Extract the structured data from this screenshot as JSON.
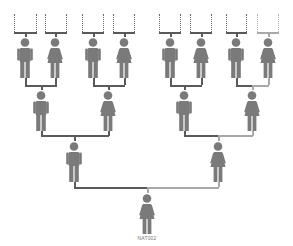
{
  "diagram": {
    "type": "pedigree-chart",
    "figure_color": "#7a7a7a",
    "line_color": "#5a5a5a",
    "light_line_color": "#a8a8a8",
    "root_label": "NAT002"
  },
  "generations": [
    {
      "level": 1,
      "people": [
        {
          "sex": "female",
          "label": "NAT002"
        }
      ]
    },
    {
      "level": 2,
      "people": [
        {
          "sex": "male"
        },
        {
          "sex": "female"
        }
      ]
    },
    {
      "level": 3,
      "people": [
        {
          "sex": "male"
        },
        {
          "sex": "female"
        },
        {
          "sex": "male"
        },
        {
          "sex": "female"
        }
      ]
    },
    {
      "level": 4,
      "people": [
        {
          "sex": "male"
        },
        {
          "sex": "female"
        },
        {
          "sex": "male"
        },
        {
          "sex": "female"
        },
        {
          "sex": "male"
        },
        {
          "sex": "female"
        },
        {
          "sex": "male"
        },
        {
          "sex": "female"
        }
      ]
    }
  ]
}
